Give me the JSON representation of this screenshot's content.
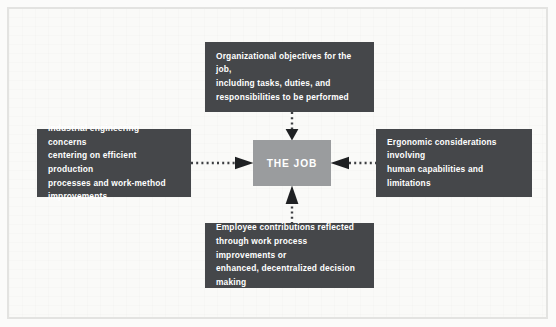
{
  "diagram": {
    "title": "The Job",
    "center": {
      "label": "THE JOB",
      "color": "#9a9c9e"
    },
    "node_color": "#45474a",
    "text_color": "#ffffff",
    "background_color": "#fafaf8",
    "border_color": "#e3e3e1",
    "nodes": [
      {
        "id": "top",
        "position": "top",
        "text": "Organizational objectives for the job,\nincluding tasks, duties, and\nresponsibilities to be performed"
      },
      {
        "id": "left",
        "position": "left",
        "text": "Industrial engineering concerns\ncentering on efficient production\nprocesses and work-method\nimprovements"
      },
      {
        "id": "right",
        "position": "right",
        "text": "Ergonomic considerations involving\nhuman capabilities and limitations"
      },
      {
        "id": "bottom",
        "position": "bottom",
        "text": "Employee contributions reflected\nthrough work process improvements or\nenhanced, decentralized decision\nmaking"
      }
    ],
    "connectors": [
      {
        "id": "top-to-center",
        "from": "top",
        "to": "center",
        "style": "dotted",
        "arrow": "down",
        "direction": "inward"
      },
      {
        "id": "bottom-to-center",
        "from": "bottom",
        "to": "center",
        "style": "dotted",
        "arrow": "up",
        "direction": "inward"
      },
      {
        "id": "left-to-center",
        "from": "left",
        "to": "center",
        "style": "dotted",
        "arrow": "right",
        "direction": "inward"
      },
      {
        "id": "right-to-center",
        "from": "right",
        "to": "center",
        "style": "dotted",
        "arrow": "left",
        "direction": "inward"
      }
    ]
  }
}
